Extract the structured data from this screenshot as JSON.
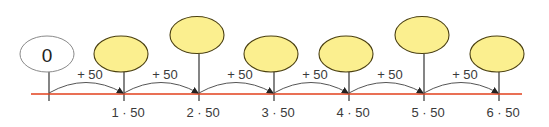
{
  "diagram": {
    "type": "number-line",
    "start_label": "0",
    "step_label": "+ 50",
    "step": 50,
    "ticks": [
      {
        "index": 0,
        "label": "",
        "value": 0,
        "balloon": "white",
        "balloon_text": "0",
        "balloon_height": "low"
      },
      {
        "index": 1,
        "label": "1 · 50",
        "value": 50,
        "balloon": "yellow",
        "balloon_text": "",
        "balloon_height": "low"
      },
      {
        "index": 2,
        "label": "2 · 50",
        "value": 100,
        "balloon": "yellow",
        "balloon_text": "",
        "balloon_height": "high"
      },
      {
        "index": 3,
        "label": "3 · 50",
        "value": 150,
        "balloon": "yellow",
        "balloon_text": "",
        "balloon_height": "low"
      },
      {
        "index": 4,
        "label": "4 · 50",
        "value": 200,
        "balloon": "yellow",
        "balloon_text": "",
        "balloon_height": "low"
      },
      {
        "index": 5,
        "label": "5 · 50",
        "value": 250,
        "balloon": "yellow",
        "balloon_text": "",
        "balloon_height": "high"
      },
      {
        "index": 6,
        "label": "6 · 50",
        "value": 300,
        "balloon": "yellow",
        "balloon_text": "",
        "balloon_height": "low"
      }
    ],
    "jumps": [
      "+ 50",
      "+ 50",
      "+ 50",
      "+ 50",
      "+ 50",
      "+ 50"
    ],
    "colors": {
      "axis_line": "#e2401c",
      "balloon_fill": "#fbef8f",
      "balloon_stroke": "#4a3f10",
      "zero_balloon_fill": "#ffffff",
      "zero_balloon_stroke": "#8a8a8a",
      "tick": "#333333",
      "arc": "#555555"
    }
  },
  "labels": {
    "zero": "0",
    "jump_0": "+ 50",
    "jump_1": "+ 50",
    "jump_2": "+ 50",
    "jump_3": "+ 50",
    "jump_4": "+ 50",
    "jump_5": "+ 50",
    "tick_1": "1 · 50",
    "tick_2": "2 · 50",
    "tick_3": "3 · 50",
    "tick_4": "4 · 50",
    "tick_5": "5 · 50",
    "tick_6": "6 · 50"
  }
}
